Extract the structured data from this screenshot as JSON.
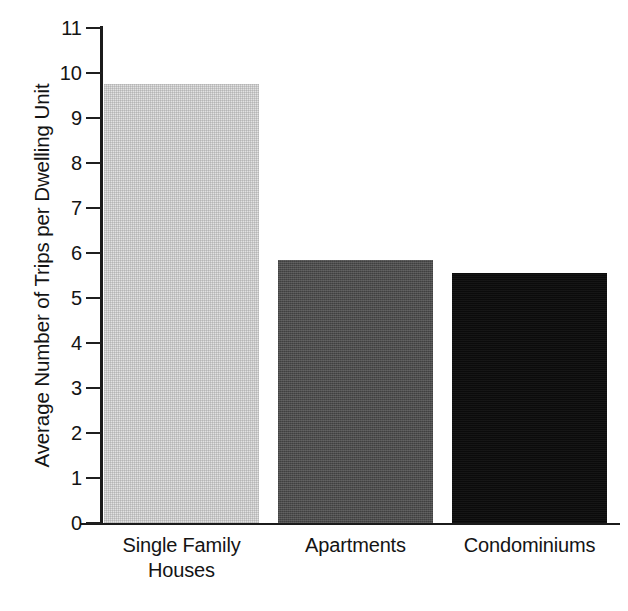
{
  "chart_data": {
    "type": "bar",
    "title": "",
    "subtitle": "",
    "xlabel": "",
    "ylabel": "Average Number of Trips per Dwelling Unit",
    "categories": [
      "Single Family Houses",
      "Apartments",
      "Condominiums"
    ],
    "category_lines": [
      [
        "Single Family",
        "Houses"
      ],
      [
        "Apartments"
      ],
      [
        "Condominiums"
      ]
    ],
    "values": [
      9.75,
      5.85,
      5.55
    ],
    "ylim": [
      0,
      11
    ],
    "ytick_labels": [
      "0",
      "1",
      "2",
      "3",
      "4",
      "5",
      "6",
      "7",
      "8",
      "9",
      "10",
      "11"
    ],
    "ytick_values": [
      0,
      1,
      2,
      3,
      4,
      5,
      6,
      7,
      8,
      9,
      10,
      11
    ],
    "grid": false,
    "legend": false,
    "legend_position": "none",
    "bar_colors": [
      "#e2e2e2",
      "#4c4c4c",
      "#0b0b0b"
    ],
    "axis_color": "#1b1b1b",
    "background_color": "#ffffff",
    "text_color": "#141414"
  }
}
